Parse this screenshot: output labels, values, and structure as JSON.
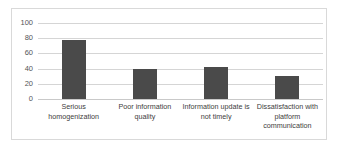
{
  "chart_data": {
    "type": "bar",
    "title": "",
    "subtitle": "",
    "xlabel": "",
    "ylabel": "",
    "categories": [
      "Serious homogenization",
      "Poor information quality",
      "Information update is not timely",
      "Dissatisfaction with platform communication"
    ],
    "values": [
      78,
      40,
      42,
      30
    ],
    "ylim": [
      0,
      100
    ],
    "yticks": [
      0,
      20,
      40,
      60,
      80,
      100
    ],
    "ytick_labels": [
      "0",
      "20",
      "40",
      "60",
      "80",
      "100"
    ],
    "grid": true,
    "grid_axis": "y",
    "legend": false,
    "legend_position": "none",
    "bar_color": "#4a4a4a",
    "gridline_color": "#d5d5d5",
    "axis_label_color": "#555555",
    "frame_border_color": "#d9d9d9",
    "background_color": "#ffffff"
  }
}
